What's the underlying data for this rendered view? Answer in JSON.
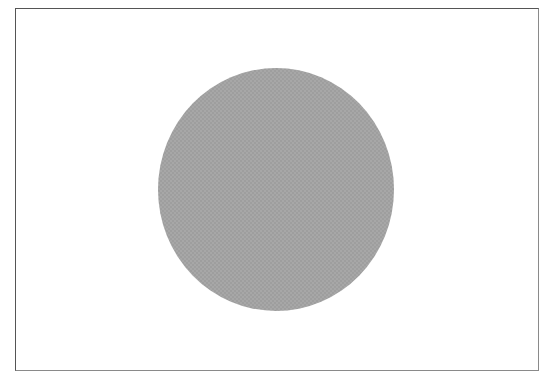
{
  "image": {
    "frame": {
      "border_color": "#555555",
      "background": "#ffffff"
    },
    "shape": {
      "type": "circle",
      "fill_color": "#a7a7a7",
      "texture": "fine-checker"
    }
  }
}
